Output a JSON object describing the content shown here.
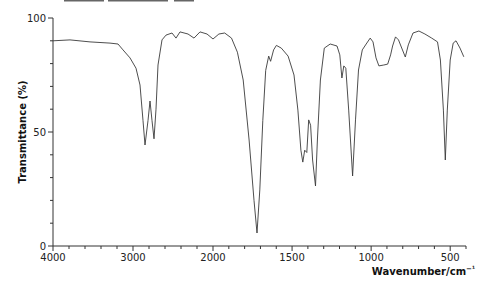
{
  "chart_data": {
    "type": "line",
    "title": "",
    "xlabel": "Wavenumber/cm⁻¹",
    "ylabel": "Transmittance (%)",
    "xlim": [
      4000,
      400
    ],
    "ylim": [
      0,
      100
    ],
    "x_axis_scale_break": 2000,
    "x_ticks": [
      4000,
      3000,
      2000,
      1500,
      1000,
      500
    ],
    "x_tick_labels": [
      "4000",
      "3000",
      "2000",
      "1500",
      "1000",
      "500"
    ],
    "y_ticks": [
      0,
      50,
      100
    ],
    "y_tick_labels": [
      "0",
      "50",
      "100"
    ],
    "grid": false,
    "legend": null,
    "series": [
      {
        "name": "IR spectrum",
        "color": "#3a3a3a",
        "x": [
          4000,
          3788,
          3538,
          3288,
          3188,
          3125,
          3038,
          2963,
          2913,
          2875,
          2850,
          2813,
          2788,
          2763,
          2738,
          2713,
          2688,
          2638,
          2588,
          2513,
          2463,
          2413,
          2313,
          2238,
          2163,
          2075,
          2000,
          1963,
          1926,
          1883,
          1846,
          1809,
          1772,
          1741,
          1722,
          1704,
          1685,
          1667,
          1648,
          1636,
          1617,
          1599,
          1568,
          1525,
          1488,
          1463,
          1444,
          1432,
          1420,
          1407,
          1395,
          1383,
          1370,
          1352,
          1340,
          1321,
          1296,
          1259,
          1216,
          1198,
          1185,
          1173,
          1160,
          1142,
          1117,
          1099,
          1080,
          1056,
          1031,
          1006,
          988,
          969,
          951,
          920,
          895,
          877,
          864,
          846,
          827,
          809,
          784,
          765,
          735,
          698,
          660,
          617,
          580,
          562,
          543,
          531,
          518,
          500,
          481,
          463,
          438,
          414
        ],
        "y": [
          90,
          90.4,
          89.5,
          89,
          88.6,
          86,
          82.5,
          78,
          70.6,
          55,
          44.3,
          55,
          63.6,
          55,
          47,
          60,
          79.4,
          90.4,
          92.5,
          93.4,
          91.2,
          93.9,
          93,
          91.2,
          93.9,
          93,
          90.8,
          93,
          93.4,
          91.2,
          85,
          72.8,
          46.5,
          20,
          5.7,
          24.6,
          55,
          77,
          83.3,
          81,
          86,
          88,
          86.8,
          83.3,
          75,
          59.6,
          42,
          36.8,
          42,
          41,
          55.3,
          53,
          37.7,
          26.3,
          46.5,
          72.8,
          86.8,
          88.6,
          87.7,
          83.8,
          73.7,
          79,
          78,
          59.6,
          30.7,
          55.3,
          77.2,
          86,
          88.6,
          91.2,
          89.5,
          82.5,
          79,
          79.4,
          79.8,
          83.8,
          87.7,
          91.7,
          90.4,
          87.3,
          82.9,
          88.2,
          93.4,
          94.3,
          93,
          91.2,
          89.5,
          81.6,
          59.6,
          37.7,
          59.6,
          81.6,
          89,
          90,
          86.8,
          83
        ]
      }
    ],
    "annotations": []
  },
  "axes": {
    "y_title": "Transmittance (%)",
    "x_title_main": "Wavenumber/cm",
    "x_title_sup": "−¹"
  }
}
